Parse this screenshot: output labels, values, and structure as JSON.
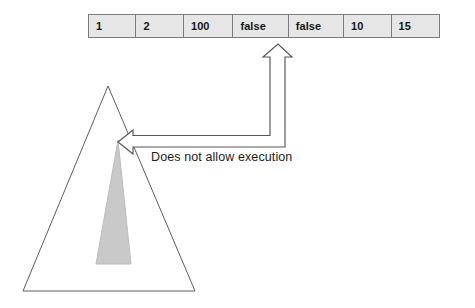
{
  "diagram": {
    "background_color": "#ffffff"
  },
  "array": {
    "name": "array-row",
    "cell_fill": "#e6e6e6",
    "border_color": "#7a7a7a",
    "cells": [
      {
        "value": "1",
        "width_class": "w-int"
      },
      {
        "value": "2",
        "width_class": "w-int"
      },
      {
        "value": "100",
        "width_class": "w-num"
      },
      {
        "value": "false",
        "width_class": "w-false"
      },
      {
        "value": "false",
        "width_class": "w-false"
      },
      {
        "value": "10",
        "width_class": "w-int"
      },
      {
        "value": "15",
        "width_class": "w-int"
      }
    ]
  },
  "annotation": {
    "text": "Does not allow execution",
    "color": "#1c1c1c"
  },
  "shapes": {
    "outer_triangle": {
      "label": "outer-triangle",
      "points": "108,86 195,291 23,291",
      "fill": "#ffffff",
      "stroke": "#5e5e5e",
      "stroke_width": 1
    },
    "inner_triangle": {
      "label": "inner-gray-triangle",
      "points": "118,140 131,264 96,264",
      "fill": "#c9c9c9",
      "stroke": "#b5b5b5",
      "stroke_width": 1
    },
    "elbow_arrow": {
      "label": "elbow-block-arrow",
      "fill": "#ffffff",
      "stroke": "#555555",
      "stroke_width": 1.2,
      "up_tip": "278,44",
      "left_tip": "118,142"
    }
  }
}
